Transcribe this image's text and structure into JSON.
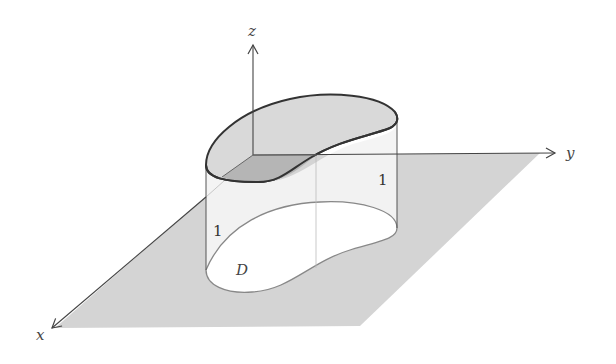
{
  "figure": {
    "axes": {
      "x_label": "x",
      "y_label": "y",
      "z_label": "z"
    },
    "region_label": "D",
    "height_labels": [
      "1",
      "1"
    ],
    "colors": {
      "plane": "#d4d4d4",
      "top_surface": "#d9d9d9",
      "top_surface_shadow": "#b5b5b5",
      "side_wall": "#f3f3f3",
      "region_fill": "#ffffff",
      "outline": "#333333",
      "axis": "#444444"
    }
  }
}
